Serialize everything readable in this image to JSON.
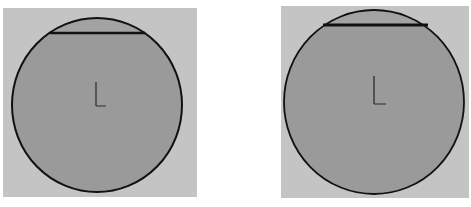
{
  "diagram": {
    "colors": {
      "background": "#ffffff",
      "panel": "#c4c4c4",
      "circle_fill": "#9a9a9a",
      "segment_fill": "#a2a2a2",
      "stroke": "#111111",
      "axis_marker": "#2a2a2a"
    },
    "panels": [
      {
        "id": "left",
        "panel_rect": {
          "x": 3,
          "y": 8,
          "w": 194,
          "h": 189
        },
        "circle": {
          "cx": 97,
          "cy": 105,
          "rx": 85,
          "ry": 87
        },
        "chord": {
          "x1": 50,
          "x2": 145,
          "y": 33
        },
        "axis_marker": {
          "x": 96,
          "y": 105
        }
      },
      {
        "id": "right",
        "panel_rect": {
          "x": 281,
          "y": 6,
          "w": 188,
          "h": 192
        },
        "circle": {
          "cx": 374,
          "cy": 102,
          "rx": 90,
          "ry": 92
        },
        "chord": {
          "x1": 323,
          "x2": 428,
          "y": 25
        },
        "axis_marker": {
          "x": 374,
          "y": 103
        }
      }
    ]
  }
}
